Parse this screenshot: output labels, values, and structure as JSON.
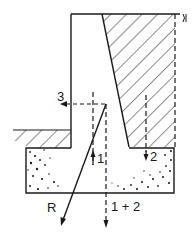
{
  "diagram": {
    "type": "retaining-wall-force-diagram",
    "colors": {
      "ink": "#1a1a1a",
      "background": "#ffffff"
    },
    "labels": {
      "force_3": "3",
      "force_1": "1",
      "force_2": "2",
      "resultant": "R",
      "sum_1_2": "1 + 2"
    },
    "elements": [
      "cantilever-wall-stem",
      "backfill-soil-hatched",
      "front-ground-hatched",
      "concrete-footing-stippled",
      "force-arrow-1-up",
      "force-arrow-2-down",
      "force-arrow-3-left",
      "resultant-arrow-R",
      "combined-force-arrow-1-plus-2"
    ]
  }
}
